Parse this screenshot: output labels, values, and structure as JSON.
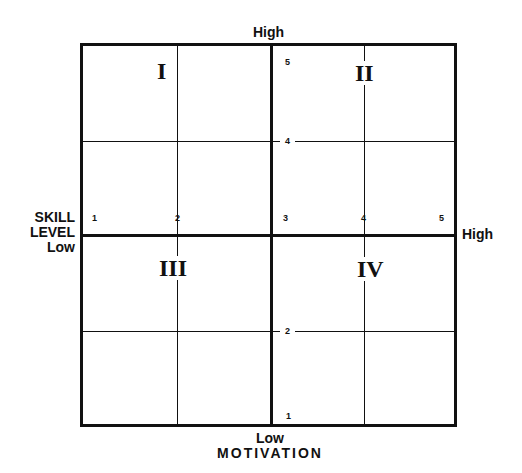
{
  "diagram": {
    "type": "quadrant_matrix",
    "x_axis": {
      "name": "SKILL LEVEL",
      "name_lines": [
        "SKILL",
        "LEVEL"
      ],
      "low_label": "Low",
      "high_label": "High",
      "ticks": [
        "1",
        "2",
        "3",
        "4",
        "5"
      ]
    },
    "y_axis": {
      "name": "MOTIVATION",
      "low_label": "Low",
      "high_label": "High",
      "ticks": [
        "1",
        "2",
        "3",
        "4",
        "5"
      ]
    },
    "quadrants": [
      {
        "id": "I",
        "label": "I",
        "position": "top-left",
        "motivation": "high",
        "skill": "low"
      },
      {
        "id": "II",
        "label": "II",
        "position": "top-right",
        "motivation": "high",
        "skill": "high"
      },
      {
        "id": "III",
        "label": "III",
        "position": "bottom-left",
        "motivation": "low",
        "skill": "low"
      },
      {
        "id": "IV",
        "label": "IV",
        "position": "bottom-right",
        "motivation": "low",
        "skill": "high"
      }
    ],
    "colors": {
      "line": "#111111",
      "background": "#ffffff"
    }
  }
}
